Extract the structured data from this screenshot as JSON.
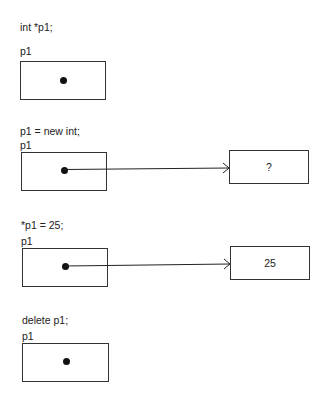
{
  "diagram": {
    "type": "pointer-memory-diagram",
    "steps": [
      {
        "statement": "int *p1;",
        "pointer_label": "p1",
        "points_to": null
      },
      {
        "statement": "p1 = new int;",
        "pointer_label": "p1",
        "points_to": {
          "value": "?"
        }
      },
      {
        "statement": "*p1 = 25;",
        "pointer_label": "p1",
        "points_to": {
          "value": "25"
        }
      },
      {
        "statement": "delete p1;",
        "pointer_label": "p1",
        "points_to": null
      }
    ]
  }
}
